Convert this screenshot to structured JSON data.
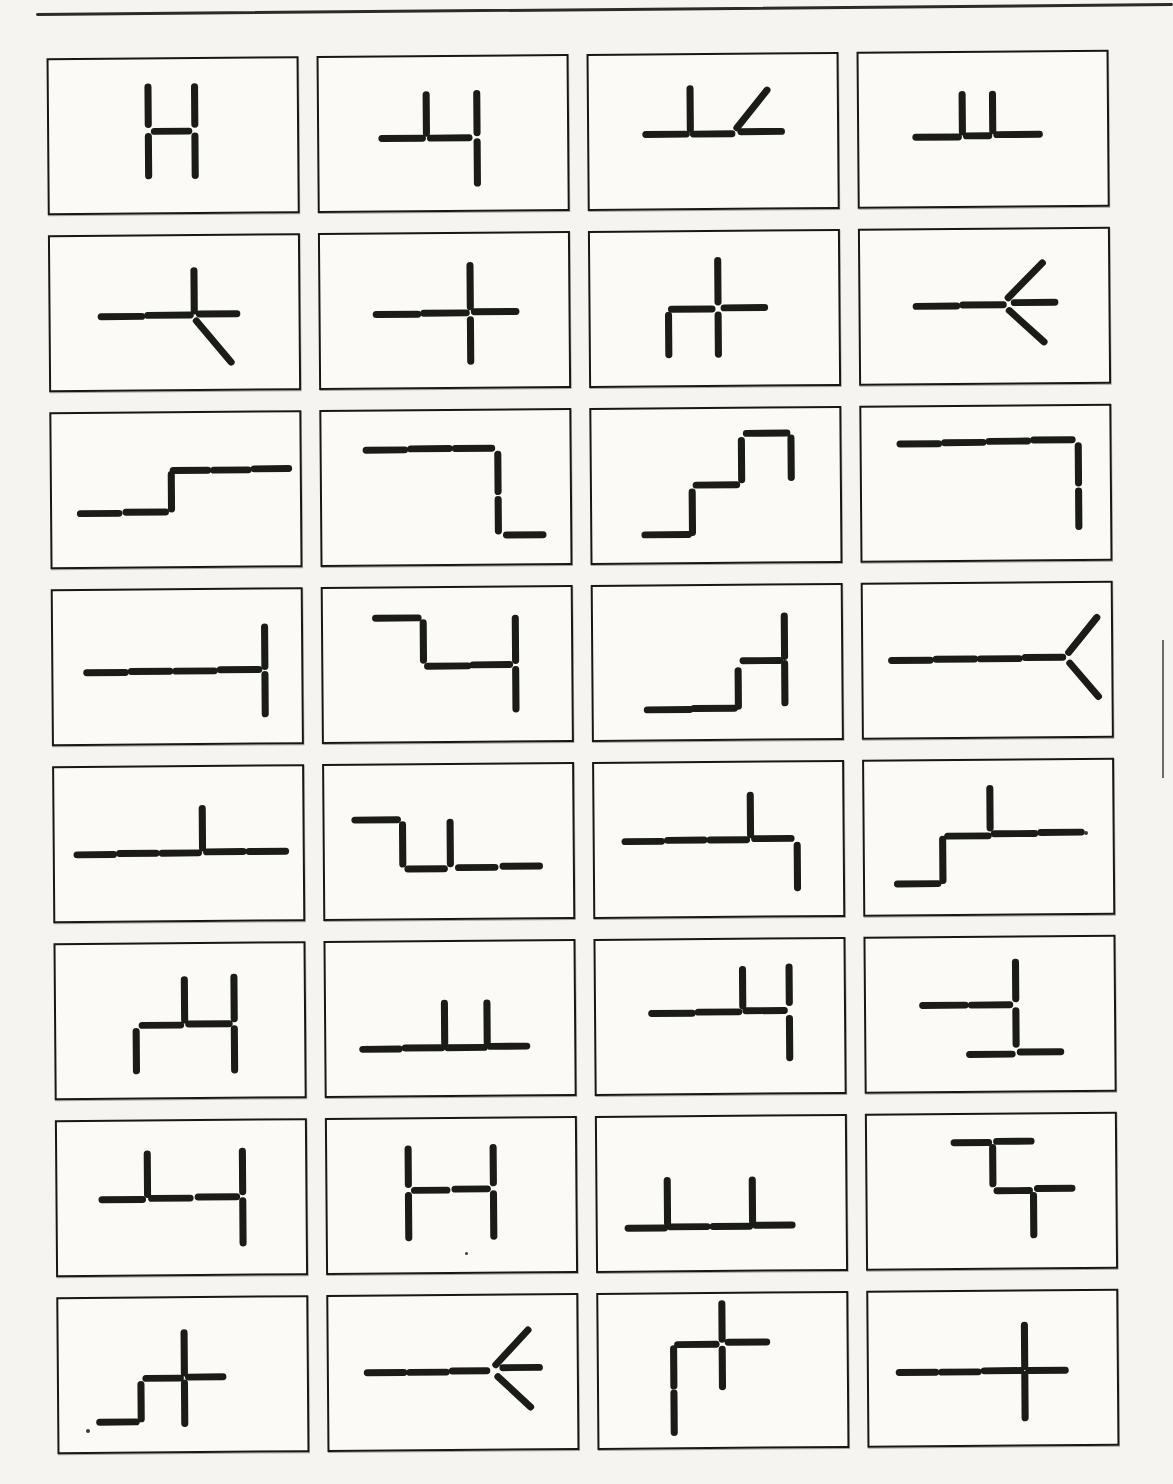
{
  "page": {
    "background": "#f5f4f0",
    "rule_color": "#2b2b28",
    "stroke_color": "#1b1b18",
    "stroke_width": 7,
    "box_border_color": "#171714",
    "box_fill": "#fbfaf7",
    "grid_rows": 8,
    "grid_cols": 4
  },
  "artifacts": {
    "specks": [
      {
        "x": 1086,
        "y": 833,
        "r": 2
      },
      {
        "x": 88,
        "y": 1431,
        "r": 2
      },
      {
        "x": 466,
        "y": 1253,
        "r": 1.5
      }
    ],
    "edge_mark": {
      "x": 1162,
      "y1": 640,
      "y2": 778
    }
  },
  "cells": [
    {
      "row": 1,
      "col": 1,
      "name": "h-shape",
      "segments": [
        [
          98,
          28,
          98,
          66
        ],
        [
          98,
          78,
          98,
          118
        ],
        [
          144,
          28,
          144,
          66
        ],
        [
          144,
          78,
          144,
          118
        ],
        [
          104,
          73,
          138,
          73
        ]
      ]
    },
    {
      "row": 1,
      "col": 2,
      "name": "four-like",
      "segments": [
        [
          62,
          82,
          102,
          82
        ],
        [
          110,
          82,
          148,
          82
        ],
        [
          106,
          38,
          106,
          77
        ],
        [
          156,
          37,
          156,
          77
        ],
        [
          156,
          86,
          156,
          128
        ]
      ]
    },
    {
      "row": 1,
      "col": 3,
      "name": "perp-with-diagonal",
      "segments": [
        [
          56,
          80,
          96,
          80
        ],
        [
          103,
          80,
          141,
          80
        ],
        [
          150,
          78,
          190,
          78
        ],
        [
          100,
          34,
          100,
          75
        ],
        [
          146,
          74,
          176,
          36
        ]
      ]
    },
    {
      "row": 1,
      "col": 4,
      "name": "double-perp",
      "segments": [
        [
          56,
          85,
          98,
          85
        ],
        [
          106,
          84,
          128,
          84
        ],
        [
          136,
          83,
          178,
          83
        ],
        [
          102,
          42,
          102,
          80
        ],
        [
          132,
          42,
          132,
          79
        ]
      ]
    },
    {
      "row": 2,
      "col": 1,
      "name": "cross-with-diagonal-leg",
      "segments": [
        [
          50,
          81,
          90,
          81
        ],
        [
          96,
          80,
          138,
          80
        ],
        [
          147,
          79,
          184,
          79
        ],
        [
          142,
          35,
          142,
          76
        ],
        [
          144,
          86,
          178,
          128
        ]
      ]
    },
    {
      "row": 2,
      "col": 2,
      "name": "plus-cross",
      "segments": [
        [
          55,
          81,
          96,
          81
        ],
        [
          102,
          80,
          144,
          80
        ],
        [
          152,
          79,
          193,
          79
        ],
        [
          148,
          32,
          148,
          74
        ],
        [
          148,
          87,
          148,
          129
        ]
      ]
    },
    {
      "row": 2,
      "col": 3,
      "name": "cross-with-two-legs",
      "segments": [
        [
          80,
          78,
          120,
          78
        ],
        [
          132,
          77,
          172,
          77
        ],
        [
          126,
          29,
          126,
          71
        ],
        [
          77,
          84,
          77,
          124
        ],
        [
          126,
          84,
          126,
          124
        ]
      ]
    },
    {
      "row": 2,
      "col": 4,
      "name": "arrow-left-three-branch",
      "segments": [
        [
          55,
          77,
          95,
          77
        ],
        [
          101,
          76,
          141,
          76
        ],
        [
          152,
          74,
          192,
          74
        ],
        [
          146,
          69,
          180,
          34
        ],
        [
          147,
          82,
          181,
          114
        ]
      ]
    },
    {
      "row": 3,
      "col": 1,
      "name": "step-up",
      "segments": [
        [
          28,
          101,
          66,
          101
        ],
        [
          73,
          100,
          112,
          100
        ],
        [
          118,
          62,
          118,
          97
        ],
        [
          120,
          58,
          154,
          58
        ],
        [
          160,
          58,
          194,
          58
        ],
        [
          200,
          57,
          234,
          57
        ]
      ]
    },
    {
      "row": 3,
      "col": 2,
      "name": "top-bar-drop",
      "segments": [
        [
          44,
          39,
          82,
          39
        ],
        [
          88,
          38,
          126,
          38
        ],
        [
          132,
          38,
          168,
          38
        ],
        [
          174,
          44,
          174,
          82
        ],
        [
          174,
          90,
          174,
          122
        ],
        [
          182,
          126,
          218,
          126
        ]
      ]
    },
    {
      "row": 3,
      "col": 3,
      "name": "staircase-up",
      "segments": [
        [
          52,
          127,
          95,
          127
        ],
        [
          99,
          84,
          99,
          125
        ],
        [
          103,
          77,
          143,
          77
        ],
        [
          148,
          32,
          148,
          72
        ],
        [
          153,
          25,
          193,
          25
        ],
        [
          197,
          30,
          197,
          70
        ]
      ]
    },
    {
      "row": 3,
      "col": 4,
      "name": "top-bar-right-drop",
      "segments": [
        [
          38,
          37,
          76,
          37
        ],
        [
          82,
          36,
          120,
          36
        ],
        [
          126,
          35,
          164,
          35
        ],
        [
          170,
          34,
          208,
          34
        ],
        [
          214,
          40,
          214,
          78
        ],
        [
          214,
          86,
          214,
          122
        ]
      ]
    },
    {
      "row": 4,
      "col": 1,
      "name": "line-crossbar-right",
      "segments": [
        [
          33,
          83,
          71,
          83
        ],
        [
          77,
          82,
          115,
          82
        ],
        [
          121,
          82,
          159,
          82
        ],
        [
          165,
          81,
          203,
          81
        ],
        [
          209,
          38,
          209,
          78
        ],
        [
          209,
          86,
          209,
          126
        ]
      ]
    },
    {
      "row": 4,
      "col": 2,
      "name": "zigzag-cross",
      "segments": [
        [
          52,
          30,
          94,
          30
        ],
        [
          99,
          35,
          99,
          73
        ],
        [
          103,
          79,
          143,
          79
        ],
        [
          148,
          78,
          184,
          78
        ],
        [
          190,
          31,
          190,
          74
        ],
        [
          190,
          83,
          190,
          123
        ]
      ]
    },
    {
      "row": 4,
      "col": 3,
      "name": "step-cross",
      "segments": [
        [
          53,
          125,
          95,
          125
        ],
        [
          99,
          124,
          139,
          124
        ],
        [
          143,
          86,
          143,
          122
        ],
        [
          148,
          76,
          184,
          76
        ],
        [
          189,
          31,
          189,
          72
        ],
        [
          189,
          79,
          189,
          119
        ]
      ]
    },
    {
      "row": 4,
      "col": 4,
      "name": "line-fork-right",
      "segments": [
        [
          28,
          77,
          66,
          77
        ],
        [
          72,
          76,
          110,
          76
        ],
        [
          116,
          76,
          154,
          76
        ],
        [
          160,
          75,
          197,
          75
        ],
        [
          203,
          70,
          231,
          35
        ],
        [
          204,
          81,
          232,
          115
        ]
      ]
    },
    {
      "row": 5,
      "col": 1,
      "name": "long-line-tick-up",
      "segments": [
        [
          22,
          88,
          58,
          88
        ],
        [
          64,
          87,
          100,
          87
        ],
        [
          106,
          87,
          142,
          87
        ],
        [
          150,
          86,
          186,
          86
        ],
        [
          192,
          86,
          228,
          86
        ],
        [
          146,
          42,
          146,
          82
        ]
      ]
    },
    {
      "row": 5,
      "col": 2,
      "name": "drop-double-stem",
      "segments": [
        [
          30,
          55,
          72,
          55
        ],
        [
          77,
          60,
          77,
          100
        ],
        [
          82,
          105,
          118,
          105
        ],
        [
          124,
          58,
          124,
          100
        ],
        [
          132,
          104,
          168,
          104
        ],
        [
          176,
          103,
          212,
          103
        ]
      ]
    },
    {
      "row": 5,
      "col": 3,
      "name": "line-tick-up-drop",
      "segments": [
        [
          30,
          79,
          66,
          79
        ],
        [
          72,
          78,
          108,
          78
        ],
        [
          114,
          78,
          150,
          78
        ],
        [
          158,
          77,
          194,
          77
        ],
        [
          154,
          33,
          154,
          73
        ],
        [
          200,
          84,
          200,
          127
        ]
      ]
    },
    {
      "row": 5,
      "col": 4,
      "name": "step-line-tick-up",
      "segments": [
        [
          32,
          124,
          72,
          124
        ],
        [
          77,
          79,
          77,
          121
        ],
        [
          82,
          76,
          122,
          76
        ],
        [
          124,
          28,
          124,
          68
        ],
        [
          128,
          74,
          168,
          74
        ],
        [
          174,
          73,
          214,
          73
        ]
      ]
    },
    {
      "row": 6,
      "col": 1,
      "name": "four-with-leg",
      "segments": [
        [
          85,
          82,
          123,
          82
        ],
        [
          131,
          81,
          171,
          81
        ],
        [
          79,
          88,
          79,
          128
        ],
        [
          127,
          36,
          127,
          77
        ],
        [
          176,
          34,
          176,
          76
        ],
        [
          176,
          86,
          176,
          128
        ]
      ]
    },
    {
      "row": 6,
      "col": 2,
      "name": "line-double-tick",
      "segments": [
        [
          36,
          108,
          72,
          108
        ],
        [
          78,
          107,
          114,
          107
        ],
        [
          120,
          107,
          156,
          107
        ],
        [
          162,
          106,
          198,
          106
        ],
        [
          117,
          62,
          117,
          102
        ],
        [
          159,
          62,
          159,
          102
        ]
      ]
    },
    {
      "row": 6,
      "col": 3,
      "name": "four-like-right",
      "segments": [
        [
          55,
          74,
          95,
          74
        ],
        [
          101,
          73,
          141,
          73
        ],
        [
          148,
          72,
          186,
          72
        ],
        [
          145,
          30,
          145,
          67
        ],
        [
          191,
          28,
          191,
          64
        ],
        [
          191,
          80,
          191,
          120
        ]
      ]
    },
    {
      "row": 6,
      "col": 4,
      "name": "tee-stack",
      "segments": [
        [
          56,
          68,
          98,
          68
        ],
        [
          104,
          68,
          142,
          68
        ],
        [
          148,
          25,
          148,
          62
        ],
        [
          148,
          74,
          148,
          108
        ],
        [
          102,
          118,
          144,
          118
        ],
        [
          152,
          116,
          192,
          116
        ]
      ]
    },
    {
      "row": 7,
      "col": 1,
      "name": "three-dash-four",
      "segments": [
        [
          44,
          79,
          84,
          79
        ],
        [
          89,
          33,
          89,
          74
        ],
        [
          93,
          78,
          131,
          78
        ],
        [
          139,
          77,
          177,
          77
        ],
        [
          183,
          31,
          183,
          72
        ],
        [
          183,
          81,
          183,
          124
        ]
      ]
    },
    {
      "row": 7,
      "col": 2,
      "name": "wide-h",
      "segments": [
        [
          80,
          30,
          80,
          66
        ],
        [
          80,
          77,
          80,
          120
        ],
        [
          164,
          29,
          164,
          65
        ],
        [
          164,
          76,
          164,
          119
        ],
        [
          86,
          72,
          118,
          72
        ],
        [
          126,
          71,
          158,
          71
        ]
      ]
    },
    {
      "row": 7,
      "col": 3,
      "name": "line-wide-double-tick",
      "segments": [
        [
          30,
          112,
          66,
          112
        ],
        [
          72,
          111,
          108,
          111
        ],
        [
          114,
          111,
          150,
          111
        ],
        [
          156,
          110,
          192,
          110
        ],
        [
          69,
          64,
          69,
          107
        ],
        [
          153,
          64,
          153,
          106
        ]
      ]
    },
    {
      "row": 7,
      "col": 4,
      "name": "double-tee-steps",
      "segments": [
        [
          86,
          28,
          120,
          28
        ],
        [
          128,
          27,
          162,
          27
        ],
        [
          124,
          33,
          124,
          70
        ],
        [
          128,
          77,
          160,
          77
        ],
        [
          168,
          75,
          202,
          75
        ],
        [
          164,
          82,
          164,
          122
        ]
      ]
    },
    {
      "row": 8,
      "col": 1,
      "name": "step-plus",
      "segments": [
        [
          40,
          125,
          76,
          125
        ],
        [
          81,
          87,
          81,
          122
        ],
        [
          86,
          81,
          120,
          81
        ],
        [
          128,
          80,
          162,
          80
        ],
        [
          124,
          35,
          124,
          76
        ],
        [
          124,
          86,
          124,
          127
        ]
      ]
    },
    {
      "row": 8,
      "col": 2,
      "name": "arrow-left-full",
      "segments": [
        [
          38,
          77,
          74,
          77
        ],
        [
          80,
          77,
          116,
          77
        ],
        [
          122,
          76,
          156,
          76
        ],
        [
          172,
          73,
          208,
          73
        ],
        [
          165,
          70,
          197,
          35
        ],
        [
          167,
          82,
          199,
          113
        ]
      ]
    },
    {
      "row": 8,
      "col": 3,
      "name": "gamma-plus",
      "segments": [
        [
          122,
          10,
          122,
          46
        ],
        [
          78,
          51,
          116,
          51
        ],
        [
          128,
          49,
          166,
          49
        ],
        [
          122,
          56,
          122,
          94
        ],
        [
          74,
          55,
          74,
          93
        ],
        [
          74,
          100,
          74,
          140
        ]
      ]
    },
    {
      "row": 8,
      "col": 4,
      "name": "long-line-plus",
      "segments": [
        [
          30,
          81,
          66,
          81
        ],
        [
          72,
          81,
          108,
          81
        ],
        [
          114,
          80,
          150,
          80
        ],
        [
          158,
          80,
          194,
          80
        ],
        [
          154,
          34,
          154,
          76
        ],
        [
          154,
          84,
          154,
          128
        ]
      ]
    }
  ]
}
